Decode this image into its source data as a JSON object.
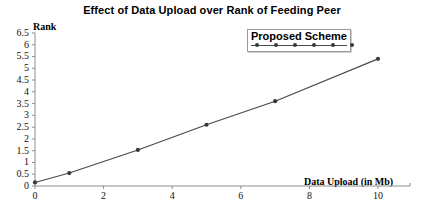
{
  "chart_data": {
    "type": "line",
    "title": "Effect of Data Upload over Rank of Feeding Peer",
    "xlabel": "Data Upload (in Mb)",
    "ylabel": "Rank",
    "x": [
      0,
      1,
      3,
      5,
      7,
      10
    ],
    "series": [
      {
        "name": "Proposed Scheme",
        "values": [
          0.15,
          0.55,
          1.53,
          2.6,
          3.6,
          5.4
        ]
      }
    ],
    "xlim": [
      0,
      11
    ],
    "ylim": [
      0,
      6.5
    ],
    "xticks": [
      0,
      2,
      4,
      6,
      8,
      10
    ],
    "xtick_labels": [
      "0",
      "2",
      "4",
      "6",
      "8",
      "10"
    ],
    "yticks": [
      0,
      0.5,
      1,
      1.5,
      2,
      2.5,
      3,
      3.5,
      4,
      4.5,
      5,
      5.5,
      6,
      6.5
    ],
    "ytick_labels": [
      "0",
      "0.5",
      "1",
      "1.5",
      "2",
      "2.5",
      "3",
      "3.5",
      "4",
      "4.5",
      "5",
      "5.5",
      "6",
      "6.5"
    ],
    "grid": false,
    "legend_position": "top-right",
    "line_color": "#4a4a4a",
    "marker_color": "#3a3a3a",
    "axis_color": "#8c8c8c"
  },
  "legend": {
    "entries": [
      {
        "label": "Proposed Scheme"
      }
    ]
  }
}
